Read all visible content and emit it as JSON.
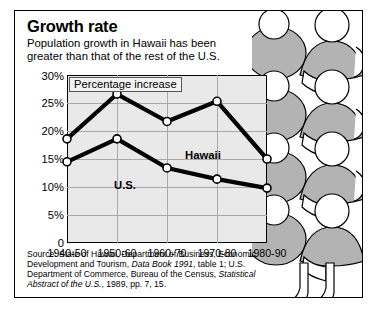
{
  "header": {
    "title": "Growth rate",
    "subtitle_line1": "Population growth in Hawaii has been",
    "subtitle_line2": "greater than that of the rest of the U.S."
  },
  "callout": "Percentage increase",
  "source": {
    "part1": "Source: State of Hawaii, Department of Business, Economic Development and Tourism, ",
    "italic1": "Data Book 1991",
    "part2": ", table 1; U.S. Department of Commerce, Bureau of the Census, ",
    "italic2": "Statistical Abstract of the U.S.",
    "part3": ", 1989, pp. 7, 15."
  },
  "chart_data": {
    "type": "line",
    "title": "Growth rate",
    "subtitle": "Population growth in Hawaii has been greater than that of the rest of the U.S.",
    "xlabel": "",
    "ylabel": "Percentage increase",
    "categories": [
      "1940-50",
      "1950-60",
      "1960-70",
      "1970-80",
      "1980-90"
    ],
    "ylim": [
      0,
      30
    ],
    "yticks": [
      "0",
      "5%",
      "10%",
      "15%",
      "20%",
      "25%",
      "30%"
    ],
    "ytick_values": [
      0,
      5,
      10,
      15,
      20,
      25,
      30
    ],
    "grid": true,
    "legend": "inline-labels",
    "series": [
      {
        "name": "Hawaii",
        "values": [
          18.6,
          26.6,
          21.7,
          25.3,
          15.0
        ],
        "color": "#000000"
      },
      {
        "name": "U.S.",
        "values": [
          14.5,
          18.6,
          13.4,
          11.4,
          9.8
        ],
        "color": "#000000"
      }
    ]
  },
  "colors": {
    "plot_background": "#e9e9e9",
    "grid": "#a9a9a9",
    "line": "#000000",
    "marker_fill": "#ffffff",
    "art_fill": "#b3b3b3"
  }
}
